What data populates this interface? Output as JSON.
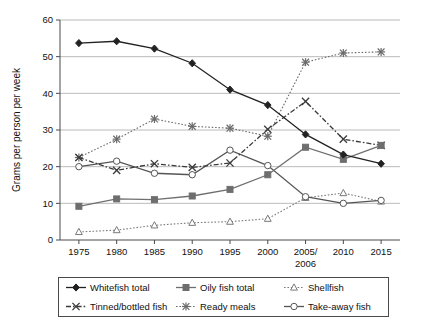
{
  "chart_data": {
    "type": "line",
    "title": "",
    "xlabel": "",
    "ylabel": "Grams per person per week",
    "ylim": [
      0,
      60
    ],
    "ytick_step": 10,
    "grid": true,
    "legend_position": "bottom",
    "categories": [
      "1975",
      "1980",
      "1985",
      "1990",
      "1995",
      "2000",
      "2005/\n2006",
      "2010",
      "2015"
    ],
    "yticks": [
      "0",
      "10",
      "20",
      "30",
      "40",
      "50",
      "60"
    ],
    "series": [
      {
        "name": "Whitefish total",
        "marker": "filled-diamond",
        "line": "solid",
        "color": "#222222",
        "values": [
          53.7,
          54.2,
          52.2,
          48.2,
          41.0,
          36.8,
          28.8,
          23.3,
          20.8
        ]
      },
      {
        "name": "Oily fish total",
        "marker": "filled-square",
        "line": "solid",
        "color": "#6e6e6e",
        "values": [
          9.2,
          11.2,
          11.0,
          12.0,
          13.8,
          17.8,
          25.3,
          22.0,
          25.8
        ]
      },
      {
        "name": "Shellfish",
        "marker": "open-triangle",
        "line": "dotted",
        "color": "#7a7a7a",
        "values": [
          2.2,
          2.7,
          4.0,
          4.7,
          5.0,
          5.8,
          11.5,
          12.8,
          10.5
        ]
      },
      {
        "name": "Tinned/bottled fish",
        "marker": "cross-x",
        "line": "dash-dot",
        "color": "#3a3a3a",
        "values": [
          22.5,
          19.0,
          20.8,
          19.8,
          21.0,
          30.2,
          37.8,
          27.5,
          25.8
        ]
      },
      {
        "name": "Ready meals",
        "marker": "asterisk",
        "line": "dotted",
        "color": "#6a6a6a",
        "values": [
          22.5,
          27.5,
          33.0,
          31.0,
          30.5,
          28.3,
          48.5,
          51.0,
          51.3
        ]
      },
      {
        "name": "Take-away fish",
        "marker": "open-circle",
        "line": "solid",
        "color": "#555555",
        "values": [
          20.0,
          21.5,
          18.2,
          17.8,
          24.5,
          20.3,
          11.8,
          10.0,
          10.8
        ]
      }
    ]
  },
  "axis": {
    "y_title": "Grams per person per week"
  },
  "legend": {
    "items": [
      {
        "label": "Whitefish total",
        "marker": "filled-diamond",
        "line": "solid"
      },
      {
        "label": "Oily fish total",
        "marker": "filled-square",
        "line": "solid"
      },
      {
        "label": "Shellfish",
        "marker": "open-triangle",
        "line": "dotted"
      },
      {
        "label": "Tinned/bottled fish",
        "marker": "cross-x",
        "line": "dash-dot"
      },
      {
        "label": "Ready meals",
        "marker": "asterisk",
        "line": "dotted"
      },
      {
        "label": "Take-away fish",
        "marker": "open-circle",
        "line": "solid"
      }
    ]
  }
}
